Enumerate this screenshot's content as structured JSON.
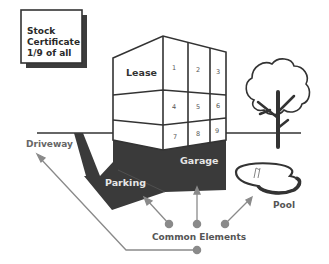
{
  "certificate": {
    "line1": "Stock",
    "line2": "Certificate",
    "line3": "1/9 of all"
  },
  "building": {
    "lease_label": "Lease",
    "units": [
      "1",
      "2",
      "3",
      "4",
      "5",
      "6",
      "7",
      "8",
      "9"
    ]
  },
  "labels": {
    "driveway": "Driveway",
    "garage": "Garage",
    "parking": "Parking",
    "pool": "Pool",
    "common_elements": "Common Elements"
  },
  "colors": {
    "line": "#333333",
    "dark_fill": "#3a3a3a",
    "pointer": "#8a8a8a",
    "label_grey": "#666666",
    "text_dark": "#2a2a2a"
  }
}
